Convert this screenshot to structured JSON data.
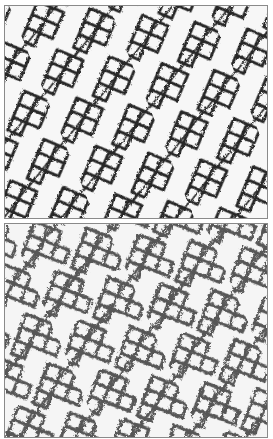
{
  "image": {
    "description": "Two stacked grayscale panels showing a diagonal lattice/mesh texture pattern",
    "panels": [
      {
        "id": "top",
        "ink_color": "#1e1e1e",
        "ink_opacity": 0.95,
        "background": "#f7f7f7"
      },
      {
        "id": "bottom",
        "ink_color": "#3a3a3a",
        "ink_opacity": 0.85,
        "background": "#f5f5f5"
      }
    ],
    "border_color": "#8a8a8a"
  }
}
